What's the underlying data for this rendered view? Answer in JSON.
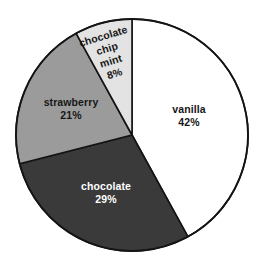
{
  "chart_data": {
    "type": "pie",
    "title": "",
    "subtitle": "",
    "xlabel": "",
    "ylabel": "",
    "legend_position": "none",
    "labels_inside": true,
    "start_angle_deg": 0,
    "direction": "clockwise",
    "categories": [
      "vanilla",
      "chocolate",
      "strawberry",
      "chocolate chip mint"
    ],
    "values": [
      42,
      29,
      21,
      8
    ],
    "value_unit": "%",
    "total": 100,
    "slices": [
      {
        "name": "vanilla",
        "label": "vanilla",
        "value": 42,
        "value_label": "42%",
        "color": "#ffffff",
        "text_color": "#171717",
        "start_deg": 0,
        "end_deg": 151.2,
        "label_rotation_deg": 0
      },
      {
        "name": "chocolate",
        "label": "chocolate",
        "value": 29,
        "value_label": "29%",
        "color": "#3a3a3a",
        "text_color": "#ffffff",
        "start_deg": 151.2,
        "end_deg": 255.6,
        "label_rotation_deg": 0
      },
      {
        "name": "strawberry",
        "label": "strawberry",
        "value": 21,
        "value_label": "21%",
        "color": "#9b9b9b",
        "text_color": "#171717",
        "start_deg": 255.6,
        "end_deg": 331.2,
        "label_rotation_deg": 0
      },
      {
        "name": "chocolate-chip-mint",
        "label": "chocolate chip mint",
        "label_lines": [
          "chocolate",
          "chip",
          "mint"
        ],
        "value": 8,
        "value_label": "8%",
        "color": "#e3e3e3",
        "text_color": "#171717",
        "start_deg": 331.2,
        "end_deg": 360.0,
        "label_rotation_deg": -17
      }
    ],
    "geometry": {
      "center_x": 132,
      "center_y": 135,
      "radius": 116
    },
    "colors": {
      "outline": "#141414",
      "background": "#ffffff",
      "vanilla": "#ffffff",
      "chocolate": "#3a3a3a",
      "strawberry": "#9b9b9b",
      "chocolate_chip_mint": "#e3e3e3"
    }
  },
  "labels": {
    "vanilla_name": "vanilla",
    "vanilla_pct": "42%",
    "chocolate_name": "chocolate",
    "chocolate_pct": "29%",
    "strawberry_name": "strawberry",
    "strawberry_pct": "21%",
    "mint_line1": "chocolate",
    "mint_line2": "chip",
    "mint_line3": "mint",
    "mint_pct": "8%"
  }
}
